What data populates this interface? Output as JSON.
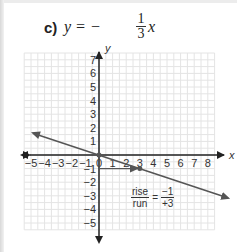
{
  "problem": {
    "label": "c)",
    "equation_prefix": "y = −",
    "fraction_numerator": "1",
    "fraction_denominator": "3",
    "equation_suffix": "x"
  },
  "annotation": {
    "rise_label": "rise",
    "run_label": "run",
    "equals": "=",
    "rise_value": "−1",
    "run_value": "+3"
  },
  "chart_data": {
    "type": "line",
    "xlabel": "x",
    "ylabel": "y",
    "xlim": [
      -5,
      8
    ],
    "ylim": [
      -5,
      7
    ],
    "grid": true,
    "x_ticks": [
      "−5",
      "−4",
      "−3",
      "−2",
      "−1",
      "0",
      "1",
      "2",
      "3",
      "4",
      "5",
      "6",
      "7",
      "8"
    ],
    "y_ticks": [
      "7",
      "6",
      "5",
      "4",
      "3",
      "2",
      "1",
      "−1",
      "−2",
      "−3",
      "−4",
      "−5"
    ],
    "series": [
      {
        "name": "y = -1/3 x",
        "slope": -0.3333,
        "intercept": 0,
        "x": [
          -5,
          0,
          3,
          9.5
        ],
        "y": [
          1.667,
          0,
          -1,
          -3.167
        ]
      }
    ],
    "annotations": [
      {
        "type": "run-arrow",
        "from": [
          0,
          -1
        ],
        "to": [
          3,
          -1
        ]
      },
      {
        "type": "point",
        "at": [
          0,
          0
        ]
      },
      {
        "type": "point",
        "at": [
          3,
          -1
        ]
      },
      {
        "type": "text",
        "text": "rise/run = −1/+3",
        "at": [
          4.5,
          -3
        ]
      }
    ],
    "colors": {
      "line": "#555555",
      "axis": "#222222",
      "grid": "#e4e4e4"
    }
  }
}
